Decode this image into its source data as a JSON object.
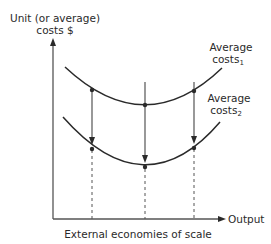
{
  "diagram": {
    "y_axis_label_line1": "Unit (or average)",
    "y_axis_label_line2": "costs $",
    "x_axis_label": "Output",
    "x_caption": "External economies of scale",
    "curve1": {
      "label_main": "Average",
      "label_costs": "costs",
      "label_sub": "1"
    },
    "curve2": {
      "label_main": "Average",
      "label_costs": "costs",
      "label_sub": "2"
    },
    "colors": {
      "line": "#2a2a2a",
      "axis": "#555555",
      "background": "#ffffff"
    }
  }
}
